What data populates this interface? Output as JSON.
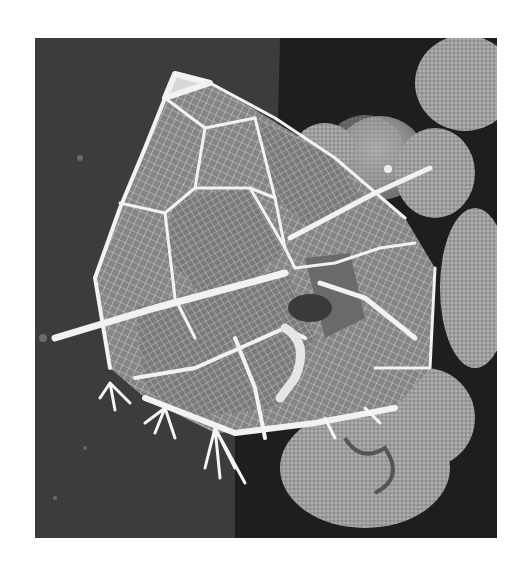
{
  "image": {
    "kind": "scanning electron micrograph",
    "subject": "dinoflagellate cyst with reticulate plates and spines",
    "palette": {
      "page_bg": "#ffffff",
      "substrate_left": "#3c3c3c",
      "substrate_right": "#1c1c1c",
      "cyst_plate": "#8a8a8a",
      "cyst_ridge": "#f2f2f2",
      "debris": "#9a9a9a"
    }
  }
}
